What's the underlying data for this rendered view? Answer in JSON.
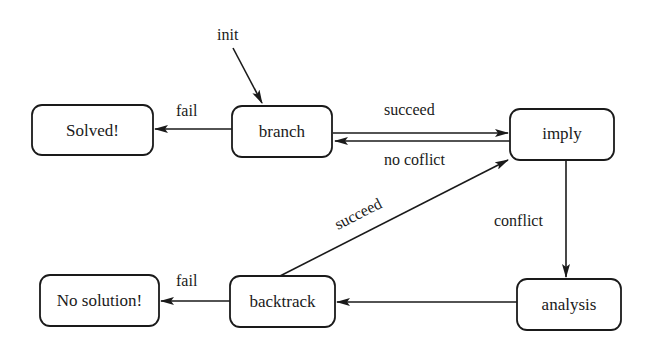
{
  "diagram": {
    "type": "state-machine",
    "nodes": [
      {
        "id": "solved",
        "label": "Solved!"
      },
      {
        "id": "branch",
        "label": "branch"
      },
      {
        "id": "imply",
        "label": "imply"
      },
      {
        "id": "no_solution",
        "label": "No solution!"
      },
      {
        "id": "backtrack",
        "label": "backtrack"
      },
      {
        "id": "analysis",
        "label": "analysis"
      }
    ],
    "edges": [
      {
        "from": "start",
        "to": "branch",
        "label": "init"
      },
      {
        "from": "branch",
        "to": "solved",
        "label": "fail"
      },
      {
        "from": "branch",
        "to": "imply",
        "label": "succeed"
      },
      {
        "from": "imply",
        "to": "branch",
        "label": "no coflict"
      },
      {
        "from": "imply",
        "to": "analysis",
        "label": "conflict"
      },
      {
        "from": "analysis",
        "to": "backtrack",
        "label": ""
      },
      {
        "from": "backtrack",
        "to": "imply",
        "label": "succeed"
      },
      {
        "from": "backtrack",
        "to": "no_solution",
        "label": "fail"
      }
    ],
    "colors": {
      "stroke": "#1a1a1a",
      "fill": "#ffffff"
    }
  }
}
